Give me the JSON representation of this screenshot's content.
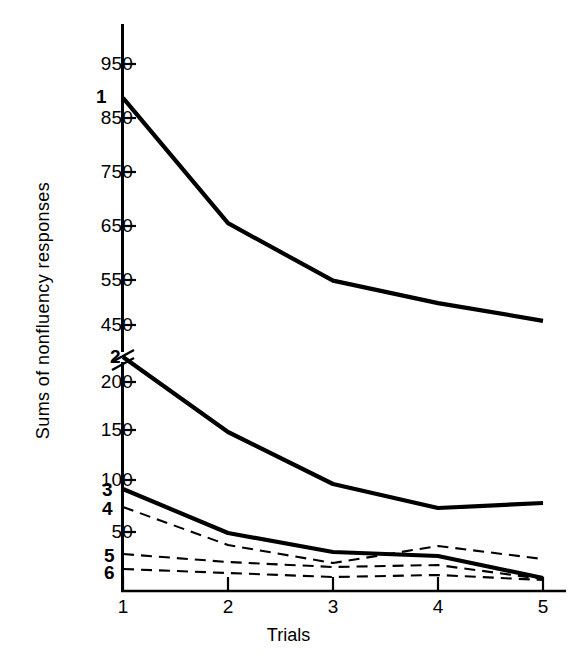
{
  "chart_data": {
    "type": "line",
    "title": "",
    "xlabel": "Trials",
    "ylabel": "Sums of nonfluency responses",
    "x": [
      1,
      2,
      3,
      4,
      5
    ],
    "xtick_labels": [
      "1",
      "2",
      "3",
      "4",
      "5"
    ],
    "ytick_labels_upper": [
      "950",
      "850",
      "750",
      "650",
      "550",
      "450"
    ],
    "ytick_values_upper": [
      950,
      850,
      750,
      650,
      550,
      450
    ],
    "ytick_labels_lower": [
      "200",
      "150",
      "100",
      "50"
    ],
    "ytick_values_lower": [
      200,
      150,
      100,
      50
    ],
    "axis_break": true,
    "axis_break_note": "y-axis broken between 450 and 200",
    "ylim_upper": [
      430,
      1000
    ],
    "ylim_lower": [
      0,
      230
    ],
    "grid": false,
    "legend_position": "inline-left-labels",
    "series": [
      {
        "name": "1",
        "label": "1",
        "style": "solid",
        "width": "thick",
        "scale": "upper",
        "values": [
          885,
          645,
          535,
          492,
          458
        ]
      },
      {
        "name": "2",
        "label": "2",
        "style": "solid",
        "width": "thick",
        "scale": "lower",
        "values": [
          225,
          150,
          98,
          74,
          79
        ]
      },
      {
        "name": "3",
        "label": "3",
        "style": "solid",
        "width": "thick",
        "scale": "lower",
        "values": [
          93,
          49,
          30,
          26,
          4
        ]
      },
      {
        "name": "4",
        "label": "4",
        "style": "dashed",
        "width": "thin",
        "scale": "lower",
        "values": [
          75,
          37,
          19,
          36,
          23
        ]
      },
      {
        "name": "5",
        "label": "5",
        "style": "dashed",
        "width": "thin",
        "scale": "lower",
        "values": [
          28,
          20,
          15,
          17,
          3
        ]
      },
      {
        "name": "6",
        "label": "6",
        "style": "dashed",
        "width": "thin",
        "scale": "lower",
        "values": [
          13,
          9,
          5,
          7,
          2
        ]
      }
    ]
  },
  "ticks": {
    "upper": [
      {
        "label": "950",
        "y": 64
      },
      {
        "label": "850",
        "y": 118
      },
      {
        "label": "750",
        "y": 172
      },
      {
        "label": "650",
        "y": 226
      },
      {
        "label": "550",
        "y": 280
      },
      {
        "label": "450",
        "y": 325
      }
    ],
    "lower": [
      {
        "label": "200",
        "y": 382
      },
      {
        "label": "150",
        "y": 430
      },
      {
        "label": "100",
        "y": 480
      },
      {
        "label": "50",
        "y": 532
      }
    ],
    "x": [
      {
        "label": "1",
        "x": 123
      },
      {
        "label": "2",
        "x": 228
      },
      {
        "label": "3",
        "x": 333
      },
      {
        "label": "4",
        "x": 438
      },
      {
        "label": "5",
        "x": 543
      }
    ]
  },
  "series_labels": [
    {
      "text": "1",
      "x": 96,
      "y": 86
    },
    {
      "text": "2",
      "x": 110,
      "y": 346
    },
    {
      "text": "3",
      "x": 102,
      "y": 479
    },
    {
      "text": "4",
      "x": 102,
      "y": 498
    },
    {
      "text": "5",
      "x": 104,
      "y": 545
    },
    {
      "text": "6",
      "x": 104,
      "y": 562
    }
  ],
  "colors": {
    "ink": "#000000",
    "background": "#ffffff"
  }
}
